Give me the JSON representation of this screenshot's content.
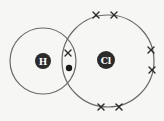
{
  "diagram": {
    "atoms": [
      {
        "symbol": "H",
        "cx": 43,
        "cy": 61,
        "shell_r": 33,
        "nucleus_r": 8
      },
      {
        "symbol": "Cl",
        "cx": 108,
        "cy": 61,
        "shell_r": 46,
        "nucleus_r": 9,
        "nucleus_cx": 106,
        "nucleus_cy": 60
      }
    ],
    "shared_electrons": [
      {
        "type": "cross",
        "x": 68,
        "y": 53,
        "owner": "Cl"
      },
      {
        "type": "dot",
        "x": 69,
        "y": 68,
        "owner": "H"
      }
    ],
    "lone_pair_electrons": [
      {
        "type": "cross",
        "x": 96,
        "y": 15
      },
      {
        "type": "cross",
        "x": 114,
        "y": 15
      },
      {
        "type": "cross",
        "x": 151,
        "y": 50
      },
      {
        "type": "cross",
        "x": 152,
        "y": 70
      },
      {
        "type": "cross",
        "x": 101,
        "y": 107
      },
      {
        "type": "cross",
        "x": 119,
        "y": 107
      }
    ],
    "colors": {
      "shell": "#6a6a6a",
      "nucleus": "#2b2b2b",
      "label": "#ffffff",
      "background": "#f6f6f4"
    }
  }
}
